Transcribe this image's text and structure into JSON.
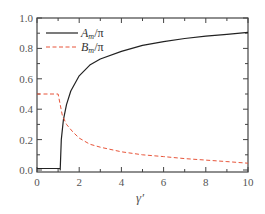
{
  "chart_data": {
    "type": "line",
    "title": "",
    "xlabel": "γ′",
    "ylabel": "",
    "xlim": [
      0,
      10
    ],
    "ylim": [
      0.0,
      1.0
    ],
    "grid": false,
    "legend_position": "upper left",
    "x_ticks": [
      "0",
      "2",
      "4",
      "6",
      "8",
      "10"
    ],
    "y_ticks": [
      "0.0",
      "0.2",
      "0.4",
      "0.6",
      "0.8",
      "1.0"
    ],
    "series": [
      {
        "name": "A_m/π",
        "legend_main": "A",
        "legend_sub": "m",
        "legend_tail": "/π",
        "style": "solid",
        "color": "#222222",
        "x": [
          0,
          1.05,
          1.1,
          1.1,
          1.15,
          1.25,
          1.4,
          1.6,
          2,
          2.5,
          3,
          4,
          5,
          6,
          7,
          8,
          9,
          10
        ],
        "y": [
          0.01,
          0.01,
          0.01,
          0.0,
          0.2,
          0.33,
          0.43,
          0.52,
          0.62,
          0.69,
          0.73,
          0.78,
          0.82,
          0.845,
          0.865,
          0.88,
          0.893,
          0.905
        ]
      },
      {
        "name": "B_m/π",
        "legend_main": "B",
        "legend_sub": "m",
        "legend_tail": "/π",
        "style": "dashed",
        "color": "#e8553a",
        "x": [
          0,
          1.0,
          1.1,
          1.2,
          1.4,
          1.7,
          2,
          2.5,
          3,
          4,
          5,
          6,
          7,
          8,
          9,
          10
        ],
        "y": [
          0.5,
          0.5,
          0.43,
          0.36,
          0.3,
          0.25,
          0.21,
          0.17,
          0.15,
          0.12,
          0.1,
          0.088,
          0.075,
          0.065,
          0.055,
          0.045
        ]
      }
    ]
  }
}
